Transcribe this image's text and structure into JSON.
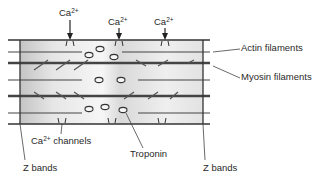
{
  "diagram": {
    "labels": {
      "ca_top_1": {
        "base": "Ca",
        "sup": "2+"
      },
      "ca_top_2": {
        "base": "Ca",
        "sup": "2+"
      },
      "ca_top_3": {
        "base": "Ca",
        "sup": "2+"
      },
      "actin": "Actin filaments",
      "myosin": "Myosin filaments",
      "ca_channels": {
        "base": "Ca",
        "sup": "2+",
        "rest": " channels"
      },
      "troponin": "Troponin",
      "z_bands_left": "Z bands",
      "z_bands_right": "Z bands"
    },
    "colors": {
      "line": "#3a3a3a",
      "shade_dark": "#c8c8c8",
      "shade_light": "#f4f4f4"
    }
  }
}
